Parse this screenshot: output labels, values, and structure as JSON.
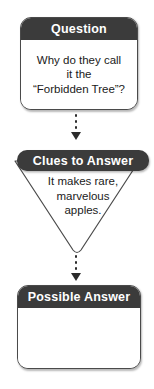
{
  "diagram": {
    "type": "flowchart",
    "orientation": "vertical",
    "background_color": "#ffffff",
    "header_color": "#3b3b3b",
    "header_text_color": "#ffffff",
    "outline_color": "#4a4a4a",
    "body_text_color": "#1a1a1a"
  },
  "nodes": {
    "question": {
      "header": "Question",
      "body": "Why do they call\nit the\n“Forbidden Tree”?",
      "shape": "rounded-rectangle"
    },
    "clues": {
      "header": "Clues to Answer",
      "body": "It makes rare,\nmarvelous\napples.",
      "shape": "inverted-triangle"
    },
    "answer": {
      "header": "Possible Answer",
      "body": "",
      "shape": "rounded-rectangle"
    }
  },
  "connectors": [
    {
      "name": "question-to-clues",
      "style": "dotted-with-arrowhead",
      "dots": 3,
      "direction": "down"
    },
    {
      "name": "clues-to-answer",
      "style": "dotted-with-arrowhead",
      "dots": 3,
      "direction": "down"
    }
  ]
}
